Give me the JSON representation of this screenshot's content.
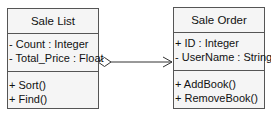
{
  "classes": [
    {
      "name": "Sale List",
      "attributes": [
        "- Count : Integer",
        "- Total_Price : Float"
      ],
      "operations": [
        "+ Sort()",
        "+ Find()"
      ]
    },
    {
      "name": "Sale Order",
      "attributes": [
        "+ ID : Integer",
        "- UserName : String"
      ],
      "operations": [
        "+ AddBook()",
        "+ RemoveBook()"
      ]
    }
  ],
  "relationship": {
    "type": "aggregation",
    "from": "Sale List",
    "to": "Sale Order",
    "source_marker": "hollow-diamond",
    "target_marker": "open-arrow"
  },
  "colors": {
    "border": "#555555",
    "fill": "#f5f5f5",
    "line": "#333333"
  }
}
